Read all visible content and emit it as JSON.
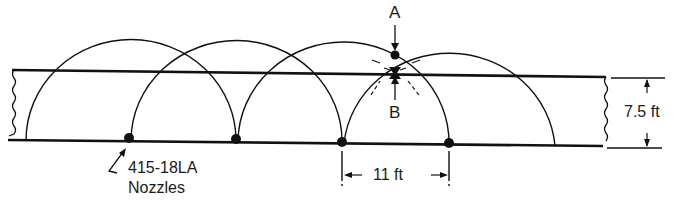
{
  "diagram": {
    "type": "nozzle-coverage-plan",
    "labels": {
      "point_a": "A",
      "point_b": "B",
      "nozzle_label_line1": "415-18LA",
      "nozzle_label_line2": "Nozzles",
      "band_width": "7.5 ft",
      "nozzle_spacing": "11 ft"
    },
    "nozzles": [
      {
        "x": 129,
        "y": 139
      },
      {
        "x": 236,
        "y": 140
      },
      {
        "x": 342,
        "y": 142
      },
      {
        "x": 449,
        "y": 143
      }
    ],
    "colors": {
      "line": "#111111",
      "background": "#ffffff"
    }
  }
}
